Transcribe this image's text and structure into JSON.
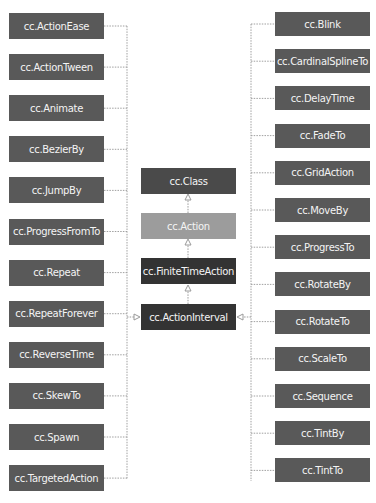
{
  "diagram": {
    "type": "class-inheritance",
    "center": [
      {
        "label": "cc.Class",
        "shade": "dark"
      },
      {
        "label": "cc.Action",
        "shade": "light"
      },
      {
        "label": "cc.FiniteTimeAction",
        "shade": "darker"
      },
      {
        "label": "cc.ActionInterval",
        "shade": "darker"
      }
    ],
    "left": [
      "cc.ActionEase",
      "cc.ActionTween",
      "cc.Animate",
      "cc.BezierBy",
      "cc.JumpBy",
      "cc.ProgressFromTo",
      "cc.Repeat",
      "cc.RepeatForever",
      "cc.ReverseTime",
      "cc.SkewTo",
      "cc.Spawn",
      "cc.TargetedAction"
    ],
    "right": [
      "cc.Blink",
      "cc.CardinalSplineTo",
      "cc.DelayTime",
      "cc.FadeTo",
      "cc.GridAction",
      "cc.MoveBy",
      "cc.ProgressTo",
      "cc.RotateBy",
      "cc.RotateTo",
      "cc.ScaleTo",
      "cc.Sequence",
      "cc.TintBy",
      "cc.TintTo"
    ],
    "colors": {
      "dark": "#4a4a4a",
      "light": "#9c9c9c",
      "darker": "#333333",
      "line": "#9a9a9a"
    }
  }
}
